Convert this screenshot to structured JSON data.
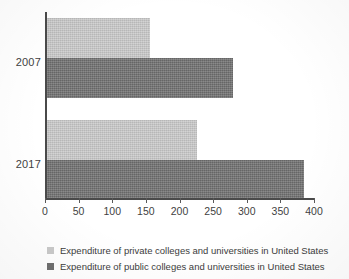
{
  "chart_data": {
    "type": "bar",
    "orientation": "horizontal",
    "title": "",
    "subtitle": "",
    "xlabel": "",
    "ylabel": "",
    "categories": [
      "2007",
      "2017"
    ],
    "series": [
      {
        "name": "Expenditure of private colleges and universities in United States",
        "color": "#c9c9c9",
        "values": [
          153,
          223
        ]
      },
      {
        "name": "Expenditure of public colleges and universities in United States",
        "color": "#6f6f6f",
        "values": [
          277,
          382
        ]
      }
    ],
    "xlim": [
      0,
      400
    ],
    "xticks": [
      0,
      50,
      100,
      150,
      200,
      250,
      300,
      350,
      400
    ],
    "xtick_labels": [
      "0",
      "50",
      "100",
      "150",
      "200",
      "250",
      "300",
      "350",
      "400"
    ],
    "grid": false,
    "legend_position": "bottom-left"
  },
  "legend": {
    "items": [
      {
        "label": "Expenditure of private colleges and universities in United States",
        "color": "#c9c9c9"
      },
      {
        "label": "Expenditure of public colleges and universities in United States",
        "color": "#6f6f6f"
      }
    ]
  },
  "axis": {
    "category_labels": [
      "2007",
      "2017"
    ],
    "tick_labels": [
      "0",
      "50",
      "100",
      "150",
      "200",
      "250",
      "300",
      "350",
      "400"
    ]
  }
}
